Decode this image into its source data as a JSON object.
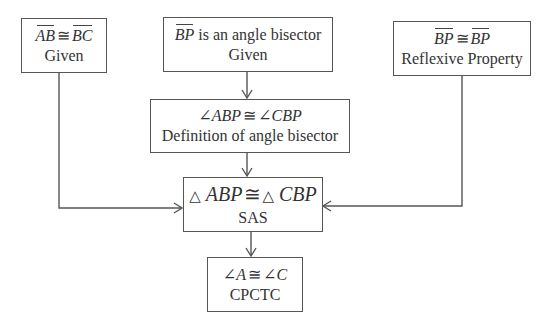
{
  "diagram": {
    "style": {
      "line_color": "#555555",
      "text_color": "#333333",
      "background": "#ffffff"
    },
    "nodes": {
      "given_ab_bc": {
        "seg_left": "AB",
        "op": "≅",
        "seg_right": "BC",
        "reason": "Given"
      },
      "bisector": {
        "seg": "BP",
        "text": " is an angle bisector",
        "reason": "Given"
      },
      "reflexive": {
        "seg_left": "BP",
        "op": "≅",
        "seg_right": "BP",
        "reason": "Reflexive Property"
      },
      "angles": {
        "sym_left": "∠",
        "name_left": "ABP",
        "op": "≅",
        "sym_right": "∠",
        "name_right": "CBP",
        "reason": "Definition of angle bisector"
      },
      "triangles": {
        "sym_left": "△",
        "name_left": "ABP",
        "op": "≅",
        "sym_right": "△",
        "name_right": "CBP",
        "reason": "SAS"
      },
      "cpctc": {
        "sym_left": "∠",
        "name_left": "A",
        "op": "≅",
        "sym_right": "∠",
        "name_right": "C",
        "reason": "CPCTC"
      }
    },
    "edges": [
      {
        "from": "given_ab_bc",
        "to": "triangles"
      },
      {
        "from": "bisector",
        "to": "angles"
      },
      {
        "from": "angles",
        "to": "triangles"
      },
      {
        "from": "reflexive",
        "to": "triangles"
      },
      {
        "from": "triangles",
        "to": "cpctc"
      }
    ]
  }
}
